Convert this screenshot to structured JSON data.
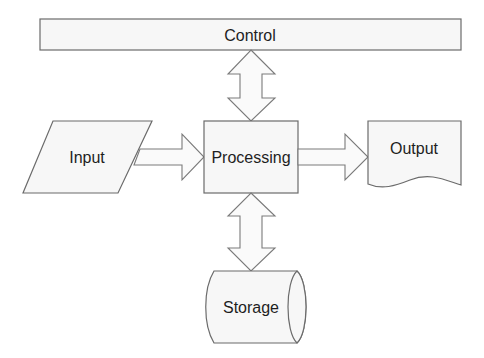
{
  "diagram": {
    "type": "flowchart",
    "nodes": {
      "control": {
        "label": "Control",
        "shape": "rectangle"
      },
      "input": {
        "label": "Input",
        "shape": "parallelogram"
      },
      "processing": {
        "label": "Processing",
        "shape": "rectangle"
      },
      "output": {
        "label": "Output",
        "shape": "document"
      },
      "storage": {
        "label": "Storage",
        "shape": "cylinder"
      }
    },
    "edges": [
      {
        "from": "control",
        "to": "processing",
        "style": "bidirectional-block-arrow"
      },
      {
        "from": "input",
        "to": "processing",
        "style": "block-arrow"
      },
      {
        "from": "processing",
        "to": "output",
        "style": "block-arrow"
      },
      {
        "from": "processing",
        "to": "storage",
        "style": "bidirectional-block-arrow"
      }
    ],
    "colors": {
      "fill": "#f7f7f7",
      "stroke": "#6b6b6b",
      "text": "#1e1e1e"
    }
  }
}
